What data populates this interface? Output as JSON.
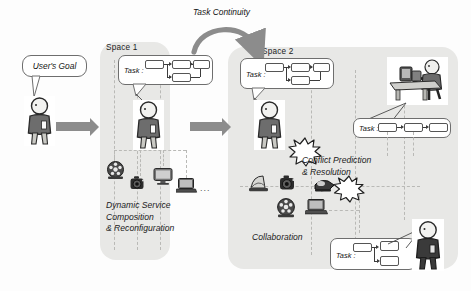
{
  "figure": {
    "type": "concept-diagram",
    "background_color": "#fdfdfd"
  },
  "flow": {
    "continuity_label": "Task Continuity",
    "user_goal_label": "User's Goal"
  },
  "spaces": [
    {
      "id": "space1",
      "label": "Space 1",
      "caption": "Dynamic Service\nComposition\n& Reconfiguration",
      "fill": "#e8e8e6"
    },
    {
      "id": "space2",
      "label": "Space 2",
      "captions": [
        "Conflict Prediction\n& Resolution",
        "Collaboration"
      ],
      "fill": "#e8e8e6"
    }
  ],
  "task_bubbles": [
    {
      "id": "task-space1",
      "label": "Task :",
      "nodes": 4
    },
    {
      "id": "task-space2-main",
      "label": "Task :",
      "nodes": 4
    },
    {
      "id": "task-space2-right",
      "label": "Task :",
      "nodes": 3
    },
    {
      "id": "task-space2-bottom",
      "label": "Task :",
      "nodes": 3
    }
  ],
  "devices": {
    "space1": [
      "film-reel-icon",
      "camera-icon",
      "monitor-icon",
      "laptop-icon"
    ],
    "space2": [
      "printer-icon",
      "camera-icon",
      "projector-icon",
      "film-reel-icon",
      "laptop-icon"
    ],
    "more_indicator": "..."
  },
  "actors": [
    {
      "id": "user-origin",
      "icon": "person-icon"
    },
    {
      "id": "user-in-space1",
      "icon": "person-icon"
    },
    {
      "id": "user-in-space2",
      "icon": "person-icon"
    },
    {
      "id": "collaborator",
      "icon": "person-icon"
    },
    {
      "id": "person-at-desk",
      "icon": "person-at-desk-photo"
    }
  ],
  "conflict": {
    "icon": "burst-icon",
    "count": 2
  },
  "colors": {
    "space_fill": "#e8e8e6",
    "arrow_grey": "#8c8c8c",
    "stroke": "#555555",
    "dashed_grid": "#b9b9b6",
    "text": "#1a1a1a"
  }
}
